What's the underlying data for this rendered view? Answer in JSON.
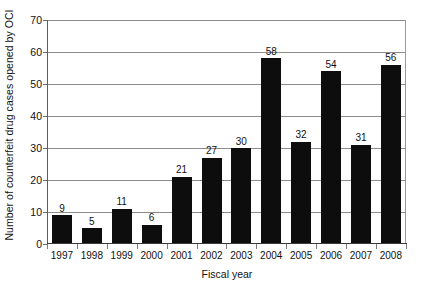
{
  "chart_data": {
    "type": "bar",
    "title": "",
    "xlabel": "Fiscal year",
    "ylabel": "Number of counterfeit drug cases opened by OCI",
    "categories": [
      "1997",
      "1998",
      "1999",
      "2000",
      "2001",
      "2002",
      "2003",
      "2004",
      "2005",
      "2006",
      "2007",
      "2008"
    ],
    "values": [
      9,
      5,
      11,
      6,
      21,
      27,
      30,
      58,
      32,
      54,
      31,
      56
    ],
    "data_labels": [
      "9",
      "5",
      "11",
      "6",
      "21",
      "27",
      "30",
      "58",
      "32",
      "54",
      "31",
      "56"
    ],
    "ylim": [
      0,
      70
    ],
    "yticks": [
      0,
      10,
      20,
      30,
      40,
      50,
      60,
      70
    ],
    "ytick_labels": [
      "0",
      "10",
      "20",
      "30",
      "40",
      "50",
      "60",
      "70"
    ],
    "grid": "horizontal",
    "legend": "none",
    "bar_color": "#0d0d0d",
    "gridline_color": "#8c8c8c",
    "background_color": "#ffffff",
    "axis_color": "#3a3a3a"
  }
}
